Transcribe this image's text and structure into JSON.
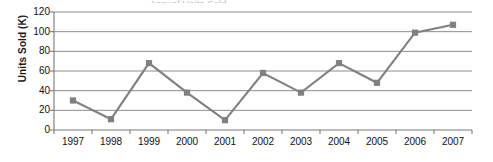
{
  "figure": {
    "title_remnant": "Annual Units Sold",
    "background_color": "#ffffff"
  },
  "chart_data": {
    "type": "line",
    "title": "",
    "xlabel": "",
    "ylabel": "Units Sold (K)",
    "categories": [
      "1997",
      "1998",
      "1999",
      "2000",
      "2001",
      "2002",
      "2003",
      "2004",
      "2005",
      "2006",
      "2007"
    ],
    "values": [
      30,
      11,
      68,
      38,
      10,
      58,
      38,
      68,
      48,
      99,
      107
    ],
    "series": [
      {
        "name": "Units Sold",
        "values": [
          30,
          11,
          68,
          38,
          10,
          58,
          38,
          68,
          48,
          99,
          107
        ],
        "line_color": "#808080",
        "marker_color": "#808080",
        "marker": "square"
      }
    ],
    "ylim": [
      0,
      120
    ],
    "yticks": [
      0,
      20,
      40,
      60,
      80,
      100,
      120
    ],
    "ytick_labels": [
      "0",
      "20",
      "40",
      "60",
      "80",
      "100",
      "120"
    ],
    "grid": true,
    "grid_axis": "y",
    "grid_color": "#8c8c8c",
    "legend": false,
    "legend_position": "none",
    "axis_color": "#7a7a7a",
    "text_color": "#111111"
  }
}
